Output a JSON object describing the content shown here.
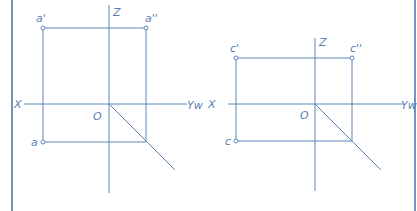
{
  "colors": {
    "line": "#5f86b8",
    "label": "#5a7fb0",
    "border": "#4c78b0",
    "background": "#ffffff"
  },
  "left_diagram": {
    "labels": {
      "z_axis": "Z",
      "x_axis": "X",
      "yw_axis": "Yw",
      "origin": "O",
      "front_view": "a'",
      "side_view": "a''",
      "top_view": "a"
    }
  },
  "right_diagram": {
    "labels": {
      "z_axis": "Z",
      "x_axis": "X",
      "yw_axis": "Yw",
      "origin": "O",
      "front_view": "c'",
      "side_view": "c''",
      "top_view": "c"
    }
  }
}
